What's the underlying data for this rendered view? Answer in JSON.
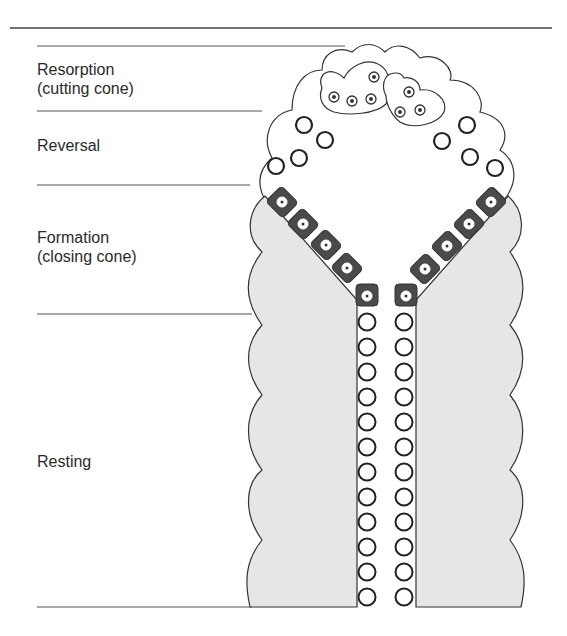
{
  "diagram": {
    "labels": {
      "resorption_line1": "Resorption",
      "resorption_line2": "(cutting cone)",
      "reversal": "Reversal",
      "formation_line1": "Formation",
      "formation_line2": "(closing cone)",
      "resting": "Resting"
    },
    "stages": [
      "Resorption (cutting cone)",
      "Reversal",
      "Formation (closing cone)",
      "Resting"
    ],
    "elements": {
      "osteoclasts": 2,
      "reversal_cells_per_side": 3,
      "osteoblasts_per_side": 5,
      "lining_cells_per_side": 12
    },
    "colors": {
      "bone_fill": "#e6e6e6",
      "osteoblast_fill": "#4a4a4a",
      "outline": "#333333",
      "background": "#ffffff"
    }
  }
}
